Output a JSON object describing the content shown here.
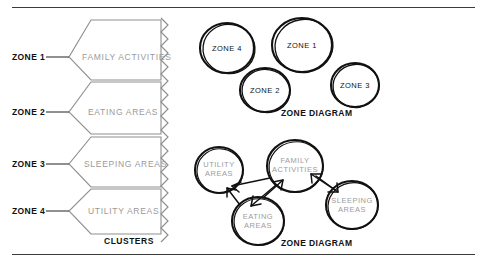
{
  "page": {
    "background_color": "#ffffff",
    "rule_color": "#3a3a3a"
  },
  "zone_list": {
    "items": [
      {
        "label": "ZONE 1",
        "cluster": "FAMILY ACTIVITIES"
      },
      {
        "label": "ZONE 2",
        "cluster": "EATING AREAS"
      },
      {
        "label": "ZONE 3",
        "cluster": "SLEEPING AREAS"
      },
      {
        "label": "ZONE 4",
        "cluster": "UTILITY AREAS"
      }
    ],
    "caption": "CLUSTERS",
    "cluster_text_color": "#9a9a9a"
  },
  "zone_diagram_top": {
    "caption": "ZONE DIAGRAM",
    "bubbles": [
      {
        "label": "ZONE 4"
      },
      {
        "label": "ZONE 1"
      },
      {
        "label": "ZONE 2"
      },
      {
        "label": "ZONE 3"
      }
    ]
  },
  "zone_diagram_bottom": {
    "caption": "ZONE DIAGRAM",
    "bubbles": [
      {
        "label": "UTILITY\nAREAS"
      },
      {
        "label": "FAMILY\nACTIVITIES"
      },
      {
        "label": "EATING\nAREAS"
      },
      {
        "label": "SLEEPING\nAREAS"
      }
    ]
  }
}
